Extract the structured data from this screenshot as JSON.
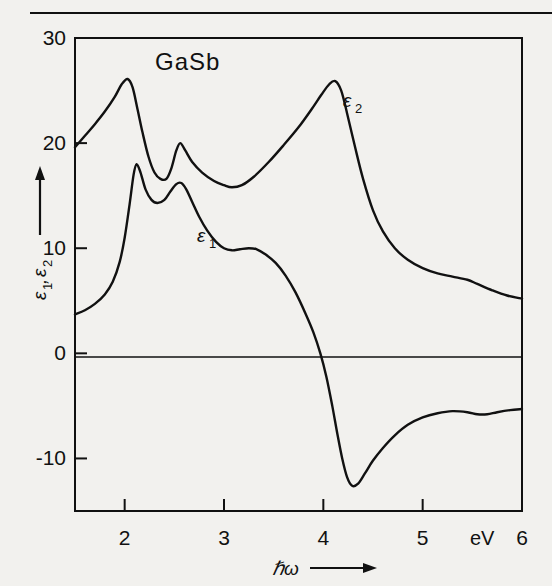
{
  "figure": {
    "title": "GaSb",
    "top_rule": true
  },
  "chart_data": {
    "type": "line",
    "title": "GaSb",
    "xlabel": "ħω",
    "xunit": "eV",
    "ylabel": "ε₁,ε₂",
    "xlim": [
      1.5,
      6.0
    ],
    "ylim": [
      -15,
      30
    ],
    "xticks": [
      2,
      3,
      4,
      5,
      6
    ],
    "xticklabels": [
      "2",
      "3",
      "4",
      "5",
      "6"
    ],
    "yticks": [
      30,
      20,
      10,
      0,
      -10
    ],
    "yticklabels": [
      "30",
      "20",
      "10",
      "0",
      "-10"
    ],
    "grid": false,
    "zero_line": true,
    "legend": "inline-annotations",
    "series": [
      {
        "name": "ε₂",
        "label": "ε₂",
        "label_sub": "2",
        "label_x": 4.27,
        "label_y": 25.8,
        "points": [
          [
            1.5,
            19.6
          ],
          [
            1.6,
            20.7
          ],
          [
            1.7,
            21.8
          ],
          [
            1.8,
            23.0
          ],
          [
            1.9,
            24.4
          ],
          [
            1.97,
            25.6
          ],
          [
            2.03,
            26.1
          ],
          [
            2.08,
            25.3
          ],
          [
            2.13,
            23.2
          ],
          [
            2.18,
            21.0
          ],
          [
            2.24,
            18.7
          ],
          [
            2.3,
            17.2
          ],
          [
            2.36,
            16.6
          ],
          [
            2.42,
            16.6
          ],
          [
            2.47,
            17.6
          ],
          [
            2.52,
            19.3
          ],
          [
            2.56,
            20.0
          ],
          [
            2.61,
            19.3
          ],
          [
            2.68,
            18.2
          ],
          [
            2.78,
            17.2
          ],
          [
            2.9,
            16.4
          ],
          [
            3.0,
            16.0
          ],
          [
            3.08,
            15.8
          ],
          [
            3.18,
            16.0
          ],
          [
            3.3,
            16.8
          ],
          [
            3.45,
            18.2
          ],
          [
            3.6,
            19.8
          ],
          [
            3.75,
            21.5
          ],
          [
            3.88,
            23.2
          ],
          [
            3.98,
            24.6
          ],
          [
            4.06,
            25.6
          ],
          [
            4.12,
            25.9
          ],
          [
            4.18,
            25.0
          ],
          [
            4.24,
            22.8
          ],
          [
            4.32,
            19.6
          ],
          [
            4.4,
            16.6
          ],
          [
            4.5,
            13.6
          ],
          [
            4.6,
            11.6
          ],
          [
            4.72,
            10.0
          ],
          [
            4.85,
            8.9
          ],
          [
            5.0,
            8.1
          ],
          [
            5.15,
            7.6
          ],
          [
            5.3,
            7.3
          ],
          [
            5.45,
            7.0
          ],
          [
            5.55,
            6.6
          ],
          [
            5.7,
            6.0
          ],
          [
            5.85,
            5.5
          ],
          [
            6.0,
            5.2
          ]
        ]
      },
      {
        "name": "ε₁",
        "label": "ε₁",
        "label_sub": "1",
        "label_x": 2.8,
        "label_y": 12.0,
        "points": [
          [
            1.5,
            3.7
          ],
          [
            1.6,
            4.1
          ],
          [
            1.7,
            4.7
          ],
          [
            1.8,
            5.6
          ],
          [
            1.88,
            6.8
          ],
          [
            1.95,
            8.7
          ],
          [
            2.0,
            11.0
          ],
          [
            2.05,
            14.2
          ],
          [
            2.09,
            17.0
          ],
          [
            2.12,
            18.0
          ],
          [
            2.16,
            17.2
          ],
          [
            2.21,
            15.6
          ],
          [
            2.27,
            14.6
          ],
          [
            2.33,
            14.3
          ],
          [
            2.4,
            14.6
          ],
          [
            2.46,
            15.4
          ],
          [
            2.52,
            16.1
          ],
          [
            2.57,
            16.2
          ],
          [
            2.62,
            15.6
          ],
          [
            2.68,
            14.4
          ],
          [
            2.75,
            13.0
          ],
          [
            2.83,
            11.7
          ],
          [
            2.92,
            10.6
          ],
          [
            3.0,
            10.0
          ],
          [
            3.08,
            9.8
          ],
          [
            3.16,
            9.9
          ],
          [
            3.25,
            10.0
          ],
          [
            3.33,
            9.9
          ],
          [
            3.42,
            9.4
          ],
          [
            3.52,
            8.6
          ],
          [
            3.62,
            7.4
          ],
          [
            3.72,
            5.8
          ],
          [
            3.82,
            3.8
          ],
          [
            3.9,
            2.0
          ],
          [
            3.97,
            0.0
          ],
          [
            4.03,
            -2.2
          ],
          [
            4.09,
            -5.0
          ],
          [
            4.14,
            -7.6
          ],
          [
            4.19,
            -10.0
          ],
          [
            4.24,
            -11.8
          ],
          [
            4.29,
            -12.6
          ],
          [
            4.35,
            -12.4
          ],
          [
            4.42,
            -11.4
          ],
          [
            4.5,
            -10.2
          ],
          [
            4.6,
            -9.0
          ],
          [
            4.72,
            -7.8
          ],
          [
            4.85,
            -6.8
          ],
          [
            5.0,
            -6.1
          ],
          [
            5.15,
            -5.7
          ],
          [
            5.3,
            -5.5
          ],
          [
            5.45,
            -5.6
          ],
          [
            5.55,
            -5.8
          ],
          [
            5.65,
            -5.8
          ],
          [
            5.75,
            -5.6
          ],
          [
            5.88,
            -5.4
          ],
          [
            6.0,
            -5.3
          ]
        ]
      }
    ]
  },
  "axis": {
    "y_arrow": "up-arrow",
    "x_arrow": "right-arrow"
  }
}
